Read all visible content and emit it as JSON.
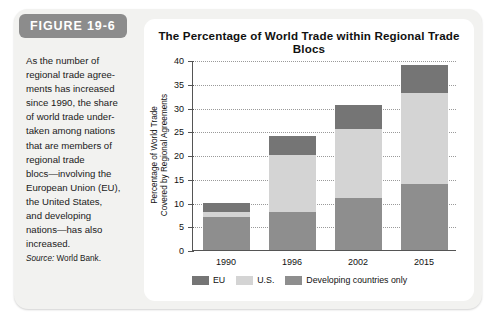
{
  "figure": {
    "badge": "FIGURE 19-6",
    "caption": "As the number of\nregional trade agree-\nments has increased\nsince 1990, the share\nof world trade under-\ntaken among nations\nthat are members of\nregional trade\nblocs—involving the\nEuropean Union (EU),\nthe United States,\nand developing\nnations—has also\nincreased.",
    "source_label": "Source:",
    "source_value": "World Bank."
  },
  "colors": {
    "panel_background": "#f2f2f0",
    "badge_background": "#8c8c8c",
    "chart_background": "#ffffff",
    "eu": "#757575",
    "us": "#d4d4d4",
    "developing": "#8e8e8e",
    "axis": "#555555",
    "gridline": "#9a9a9a"
  },
  "chart_data": {
    "type": "bar",
    "stacked": true,
    "title": "The Percentage of World Trade within Regional Trade Blocs",
    "xlabel": "",
    "ylabel": "Percentage of World Trade Covered by Regional Agreements",
    "ylabel_line1": "Percentage of World Trade",
    "ylabel_line2": "Covered by Regional Agreements",
    "categories": [
      "1990",
      "1996",
      "2002",
      "2015"
    ],
    "ylim": [
      0,
      40
    ],
    "yticks": [
      0,
      5,
      10,
      15,
      20,
      25,
      30,
      35,
      40
    ],
    "grid": true,
    "legend_position": "bottom",
    "series": [
      {
        "name": "Developing countries only",
        "color": "#8e8e8e",
        "values": [
          7.0,
          8.0,
          11.0,
          14.0
        ]
      },
      {
        "name": "U.S.",
        "color": "#d4d4d4",
        "values": [
          1.0,
          12.0,
          14.5,
          19.0
        ]
      },
      {
        "name": "EU",
        "color": "#757575",
        "values": [
          2.0,
          4.0,
          5.0,
          6.0
        ]
      }
    ],
    "totals": [
      10.0,
      24.0,
      30.5,
      39.0
    ],
    "legend": [
      {
        "label": "EU",
        "color": "#757575"
      },
      {
        "label": "U.S.",
        "color": "#d4d4d4"
      },
      {
        "label": "Developing countries only",
        "color": "#8e8e8e"
      }
    ]
  }
}
